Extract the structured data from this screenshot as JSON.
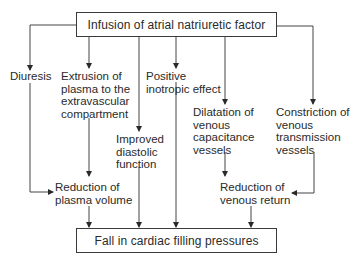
{
  "diagram": {
    "top_box": "Infusion of atrial natriuretic factor",
    "bottom_box": "Fall in cardiac filling pressures",
    "nodes": {
      "diuresis": "Diuresis",
      "extrusion": "Extrusion of\nplasma to the\nextravascular\ncompartment",
      "positive_inotropic": "Positive\ninotropic effect",
      "improved_diastolic": "Improved\ndiastolic\nfunction",
      "dilatation": "Dilatation of\nvenous\ncapacitance\nvessels",
      "constriction": "Constriction of\nvenous\ntransmission\nvessels",
      "reduction_plasma": "Reduction of\nplasma volume",
      "reduction_venous": "Reduction of\nvenous return"
    },
    "edges": [
      [
        "top_box",
        "diuresis"
      ],
      [
        "top_box",
        "extrusion"
      ],
      [
        "top_box",
        "improved_diastolic"
      ],
      [
        "top_box",
        "positive_inotropic"
      ],
      [
        "top_box",
        "dilatation"
      ],
      [
        "top_box",
        "constriction"
      ],
      [
        "diuresis",
        "reduction_plasma"
      ],
      [
        "extrusion",
        "reduction_plasma"
      ],
      [
        "dilatation",
        "reduction_venous"
      ],
      [
        "constriction",
        "reduction_venous"
      ],
      [
        "reduction_plasma",
        "bottom_box"
      ],
      [
        "improved_diastolic",
        "bottom_box"
      ],
      [
        "positive_inotropic",
        "bottom_box"
      ],
      [
        "reduction_venous",
        "bottom_box"
      ]
    ]
  }
}
